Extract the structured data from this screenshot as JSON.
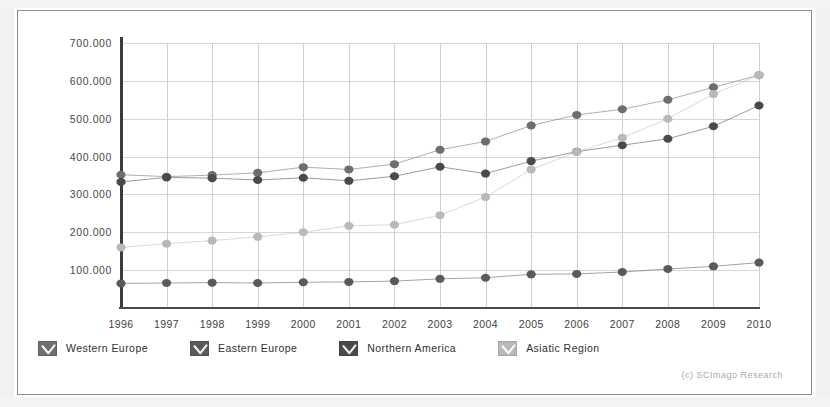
{
  "credit": "(c) SCImago Research",
  "legend": {
    "items": [
      {
        "label": "Western Europe",
        "color": "#6e6e6e",
        "swatch": "checkbox-swatch"
      },
      {
        "label": "Eastern Europe",
        "color": "#5a5a5a",
        "swatch": "checkbox-swatch"
      },
      {
        "label": "Northern America",
        "color": "#4a4a4a",
        "swatch": "checkbox-swatch"
      },
      {
        "label": "Asiatic Region",
        "color": "#b9b9b9",
        "swatch": "checkbox-swatch"
      }
    ]
  },
  "chart_data": {
    "type": "line",
    "title": "",
    "subtitle": "",
    "xlabel": "",
    "ylabel": "",
    "grid": true,
    "legend_position": "bottom",
    "xlim": [
      1996,
      2010
    ],
    "ylim": [
      0,
      700000
    ],
    "yticks": [
      100000,
      200000,
      300000,
      400000,
      500000,
      600000,
      700000
    ],
    "ytick_labels": [
      "100.000",
      "200.000",
      "300.000",
      "400.000",
      "500.000",
      "600.000",
      "700.000"
    ],
    "categories": [
      1996,
      1997,
      1998,
      1999,
      2000,
      2001,
      2002,
      2003,
      2004,
      2005,
      2006,
      2007,
      2008,
      2009,
      2010
    ],
    "xtick_labels": [
      "1996",
      "1997",
      "1998",
      "1999",
      "2000",
      "2001",
      "2002",
      "2003",
      "2004",
      "2005",
      "2006",
      "2007",
      "2008",
      "2009",
      "2010"
    ],
    "series": [
      {
        "name": "Western Europe",
        "color": "#6e6e6e",
        "marker": "circle",
        "values": [
          352000,
          347000,
          351000,
          357000,
          372000,
          366000,
          380000,
          418000,
          440000,
          482000,
          510000,
          525000,
          550000,
          583000,
          615000
        ]
      },
      {
        "name": "Eastern Europe",
        "color": "#5a5a5a",
        "marker": "circle",
        "values": [
          65000,
          66000,
          67000,
          66000,
          68000,
          69000,
          71000,
          77000,
          80000,
          89000,
          90000,
          95000,
          103000,
          110000,
          120000
        ]
      },
      {
        "name": "Northern America",
        "color": "#4a4a4a",
        "marker": "circle",
        "values": [
          333000,
          345000,
          343000,
          338000,
          344000,
          336000,
          348000,
          373000,
          355000,
          388000,
          413000,
          430000,
          447000,
          480000,
          535000
        ]
      },
      {
        "name": "Asiatic Region",
        "color": "#b9b9b9",
        "marker": "circle",
        "values": [
          160000,
          170000,
          178000,
          188000,
          200000,
          217000,
          220000,
          245000,
          293000,
          366000,
          412000,
          450000,
          500000,
          565000,
          615000
        ]
      }
    ]
  }
}
